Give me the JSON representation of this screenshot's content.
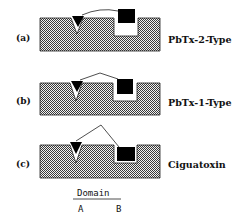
{
  "figure": {
    "panels": [
      {
        "id": "a",
        "label": "(a)",
        "type_label": "PbTx-2-Type",
        "ligand_link": "curved arc",
        "domain_B_fit": "square above pocket"
      },
      {
        "id": "b",
        "label": "(b)",
        "type_label": "PbTx-1-Type",
        "ligand_link": "angled peak",
        "domain_B_fit": "square partially in pocket"
      },
      {
        "id": "c",
        "label": "(c)",
        "type_label": "Ciguatoxin",
        "ligand_link": "angled peak",
        "domain_B_fit": "square fully in pocket"
      }
    ],
    "legend": {
      "title": "Domain",
      "domain_a": "A",
      "domain_b": "B"
    },
    "colors": {
      "receptor_fill": "#8a8a8a",
      "receptor_outline": "#222222",
      "ligand_fill": "#000000",
      "background": "#ffffff"
    }
  }
}
